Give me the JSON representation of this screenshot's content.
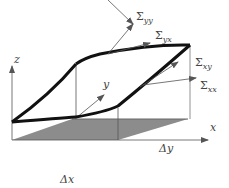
{
  "diagram": {
    "axes": {
      "x_label": "x",
      "y_label": "y",
      "z_label": "z"
    },
    "base": {
      "dx_label": "Δx",
      "dy_label": "Δy",
      "fill_color": "#8c8c8c"
    },
    "stresses": [
      {
        "symbol": "Σ",
        "subscript": "yy"
      },
      {
        "symbol": "Σ",
        "subscript": "yx"
      },
      {
        "symbol": "Σ",
        "subscript": "xy"
      },
      {
        "symbol": "Σ",
        "subscript": "xx"
      }
    ],
    "colors": {
      "surface_edge": "#111111",
      "thin_line": "#555555",
      "text": "#444444"
    }
  }
}
